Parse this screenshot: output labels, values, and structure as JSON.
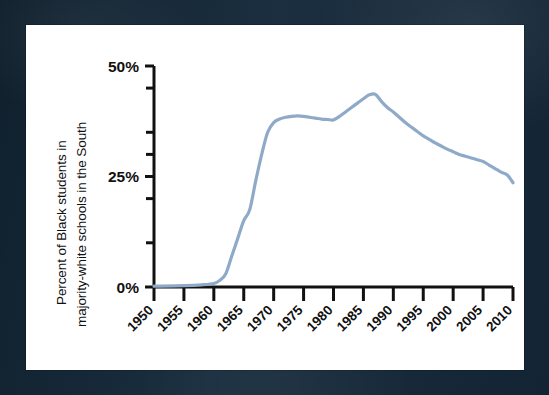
{
  "figure": {
    "background_color": "#16293a",
    "card_color": "#ffffff",
    "axis_color": "#111111",
    "line_color": "#8faac8"
  },
  "chart_data": {
    "type": "line",
    "title": "",
    "subtitle": "",
    "xlabel": "",
    "ylabel": "Percent of Black students in majority-white schools in the South",
    "ylabel_lines": [
      "Percent of Black students in",
      "majority-white schools in the South"
    ],
    "xlim": [
      1950,
      2010
    ],
    "ylim": [
      0,
      50
    ],
    "grid": false,
    "legend": false,
    "legend_position": "none",
    "y_tick_labels": [
      "50%",
      "25%",
      "0%"
    ],
    "y_tick_values": [
      50,
      25,
      0
    ],
    "y_minor_tick_values": [
      45,
      35,
      30,
      20,
      10
    ],
    "x_tick_labels": [
      "1950",
      "1955",
      "1960",
      "1965",
      "1970",
      "1975",
      "1980",
      "1985",
      "1990",
      "1995",
      "2000",
      "2005",
      "2010"
    ],
    "x_tick_values": [
      1950,
      1955,
      1960,
      1965,
      1970,
      1975,
      1980,
      1985,
      1990,
      1995,
      2000,
      2005,
      2010
    ],
    "x_tick_label_rotation": 45,
    "series": [
      {
        "name": "Percent of Black students in majority-white schools in the South",
        "color": "#8faac8",
        "x": [
          1950,
          1955,
          1958,
          1960,
          1961,
          1962,
          1963,
          1964,
          1965,
          1966,
          1967,
          1968,
          1969,
          1970,
          1971,
          1972,
          1973,
          1974,
          1975,
          1976,
          1977,
          1978,
          1979,
          1980,
          1981,
          1982,
          1983,
          1984,
          1985,
          1986,
          1987,
          1988,
          1989,
          1990,
          1991,
          1992,
          1993,
          1994,
          1995,
          1996,
          1997,
          1998,
          1999,
          2000,
          2001,
          2002,
          2003,
          2004,
          2005,
          2006,
          2007,
          2008,
          2009,
          2010
        ],
        "y": [
          0.2,
          0.3,
          0.5,
          0.8,
          1.5,
          3.0,
          7.0,
          11.0,
          15.0,
          17.5,
          24.0,
          30.0,
          35.0,
          37.2,
          38.0,
          38.4,
          38.6,
          38.7,
          38.6,
          38.4,
          38.2,
          38.0,
          37.9,
          37.8,
          38.6,
          39.6,
          40.6,
          41.6,
          42.6,
          43.5,
          43.6,
          42.0,
          40.6,
          39.6,
          38.4,
          37.2,
          36.2,
          35.2,
          34.2,
          33.4,
          32.6,
          31.9,
          31.2,
          30.6,
          30.0,
          29.6,
          29.2,
          28.8,
          28.4,
          27.6,
          26.8,
          26.0,
          25.4,
          23.6
        ]
      }
    ],
    "annotations": []
  }
}
